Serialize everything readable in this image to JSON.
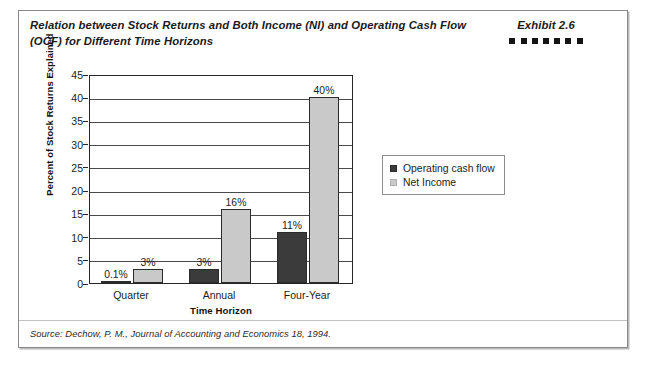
{
  "exhibit": {
    "title_line_1": "Relation between Stock Returns and Both Income (NI) and Operating Cash Flow",
    "title_line_2": "(OCF) for Different Time Horizons",
    "label": "Exhibit 2.6",
    "dot_count": 7,
    "source": "Source: Dechow, P. M., Journal of Accounting and Economics 18, 1994."
  },
  "colors": {
    "operating_cash_flow": "#3b3b3b",
    "net_income": "#c9c9c9",
    "axis": "#272727",
    "gridline": "#4a4a4a",
    "frame_border": "#8a8a8a"
  },
  "chart_data": {
    "type": "bar",
    "title": "Relation between Stock Returns and Both Income (NI) and Operating Cash Flow (OCF) for Different Time Horizons",
    "xlabel": "Time Horizon",
    "ylabel": "Percent of Stock Returns Explained",
    "categories": [
      "Quarter",
      "Annual",
      "Four-Year"
    ],
    "ylim": [
      0,
      45
    ],
    "yticks": [
      0,
      5,
      10,
      15,
      20,
      25,
      30,
      35,
      40,
      45
    ],
    "grid": true,
    "legend_position": "right",
    "series": [
      {
        "name": "Operating cash flow",
        "values": [
          0.1,
          3,
          11
        ],
        "labels": [
          "0.1%",
          "3%",
          "11%"
        ]
      },
      {
        "name": "Net Income",
        "values": [
          3,
          16,
          40
        ],
        "labels": [
          "3%",
          "16%",
          "40%"
        ]
      }
    ]
  }
}
